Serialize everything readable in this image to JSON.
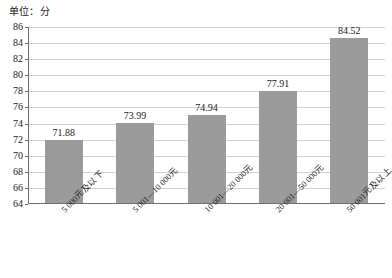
{
  "chart_data": {
    "type": "bar",
    "title": "单位：分",
    "xlabel": "",
    "ylabel": "",
    "ylim": [
      64,
      86
    ],
    "yticks": [
      64,
      66,
      68,
      70,
      72,
      74,
      76,
      78,
      80,
      82,
      84,
      86
    ],
    "grid": true,
    "legend": "none",
    "bar_color": "#9b9b9b",
    "categories": [
      "5 000元及以下",
      "5 001—10 000元",
      "10 001—20 000元",
      "20 001—50 000元",
      "50 001元及以上"
    ],
    "values": [
      71.88,
      73.99,
      74.94,
      77.91,
      84.52
    ],
    "value_labels": [
      "71.88",
      "73.99",
      "74.94",
      "77.91",
      "84.52"
    ],
    "ytick_labels": [
      "64",
      "66",
      "68",
      "70",
      "72",
      "74",
      "76",
      "78",
      "80",
      "82",
      "84",
      "86"
    ]
  }
}
